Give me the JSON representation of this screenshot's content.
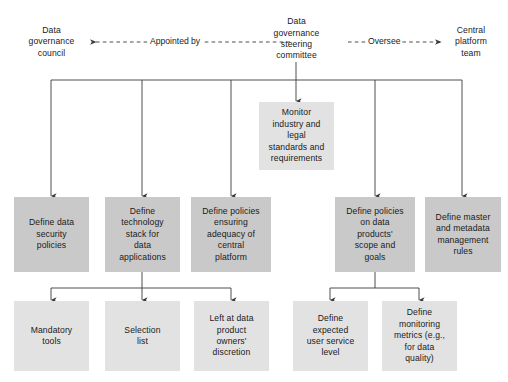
{
  "diagram": {
    "colors": {
      "shaded_dark": "#c9c9c9",
      "shaded_light": "#e2e2e2",
      "line": "#3a3a3a",
      "text": "#1a1a1a",
      "background": "#ffffff"
    },
    "top_row": {
      "council": "Data\ngovernance\ncouncil",
      "steering_committee": "Data\ngovernance\nsteering\ncommittee",
      "central_platform_team": "Central\nplatform\nteam"
    },
    "edge_labels": {
      "appointed_by": "Appointed by",
      "oversee": "Oversee"
    },
    "monitor_box": "Monitor\nindustry and\nlegal\nstandards and\nrequirements",
    "middle_row": [
      "Define data\nsecurity\npolicies",
      "Define\ntechnology\nstack for\ndata\napplications",
      "Define policies\nensuring\nadequacy of\ncentral\nplatform",
      "Define policies\non data\nproducts'\nscope and\ngoals",
      "Define master\nand metadata\nmanagement\nrules"
    ],
    "bottom_row": [
      "Mandatory\ntools",
      "Selection\nlist",
      "Left at data\nproduct\nowners'\ndiscretion",
      "Define\nexpected\nuser service\nlevel",
      "Define\nmonitoring\nmetrics (e.g.,\nfor data\nquality)"
    ]
  }
}
